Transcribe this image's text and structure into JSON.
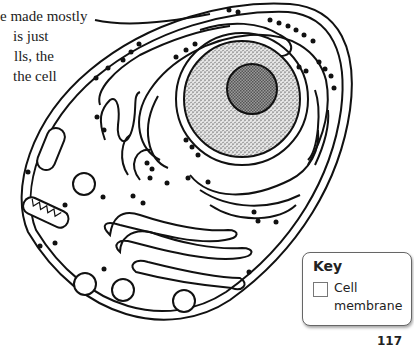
{
  "body_text": {
    "lines": [
      "e made mostly",
      "is just",
      "lls, the",
      "the cell"
    ]
  },
  "diagram": {
    "structures": [
      "cell-membrane",
      "nucleus",
      "nucleolus",
      "rough-endoplasmic-reticulum",
      "ribosomes",
      "golgi-apparatus",
      "mitochondrion",
      "lysosome",
      "vesicles"
    ],
    "colors": {
      "line": "#111111",
      "nucleus_fill": "#c8c8c8",
      "nucleolus_fill": "#7a7a7a",
      "background": "#ffffff"
    }
  },
  "key": {
    "title": "Key",
    "items": [
      {
        "label": "Cell membrane",
        "swatch_color": "#ffffff"
      }
    ]
  },
  "page": {
    "number": "117"
  }
}
